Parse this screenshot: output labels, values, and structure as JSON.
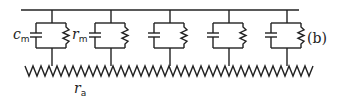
{
  "diagram": {
    "figure_label": "(b)",
    "labels": {
      "membrane_capacitance": {
        "symbol": "c",
        "subscript": "m"
      },
      "membrane_resistance": {
        "symbol": "r",
        "subscript": "m"
      },
      "axial_resistance": {
        "symbol": "r",
        "subscript": "a"
      }
    },
    "cell_count": 5,
    "stroke_color": "#222222",
    "background_color": "#ffffff"
  }
}
